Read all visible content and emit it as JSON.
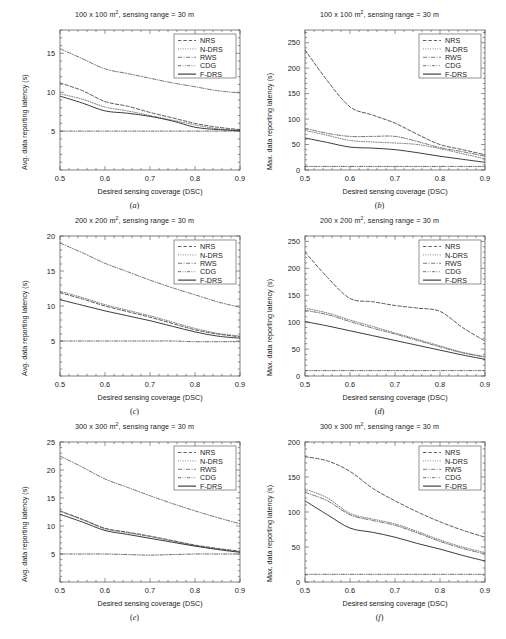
{
  "figure": {
    "xlabel": "Desired sensing coverage (DSC)",
    "ylabel_avg": "Avg. data reporting latency (s)",
    "ylabel_max": "Max. data reporting latency (s)",
    "xticks": [
      "0.5",
      "0.6",
      "0.7",
      "0.8",
      "0.9"
    ],
    "series_names": [
      "NRS",
      "N-DRS",
      "RWS",
      "CDG",
      "F-DRS"
    ],
    "panel_letters": [
      "(a)",
      "(b)",
      "(c)",
      "(d)",
      "(e)",
      "(f)"
    ]
  },
  "chart_data": [
    {
      "id": "a",
      "type": "line",
      "title": "100 x 100 m², sensing range = 30 m",
      "panel_label": "(a)",
      "xlabel": "Desired sensing coverage (DSC)",
      "ylabel": "Avg. data reporting latency (s)",
      "xlim": [
        0.5,
        0.9
      ],
      "ylim": [
        0,
        18
      ],
      "xticks": [
        0.5,
        0.6,
        0.7,
        0.8,
        0.9
      ],
      "yticks": [
        5,
        10,
        15
      ],
      "ytick_labels": [
        "5",
        "10",
        "15"
      ],
      "grid": false,
      "legend_position": "top-right",
      "x": [
        0.5,
        0.55,
        0.6,
        0.65,
        0.7,
        0.75,
        0.8,
        0.85,
        0.9
      ],
      "series": [
        {
          "name": "NRS",
          "style": "dashed",
          "values": [
            11.2,
            10.2,
            8.8,
            8.2,
            7.4,
            6.7,
            6.0,
            5.5,
            5.2
          ]
        },
        {
          "name": "N-DRS",
          "style": "dotted",
          "values": [
            9.8,
            9.1,
            8.1,
            7.6,
            7.0,
            6.4,
            5.8,
            5.3,
            5.0
          ]
        },
        {
          "name": "RWS",
          "style": "dashdot",
          "values": [
            15.6,
            14.3,
            13.0,
            12.4,
            11.8,
            11.2,
            10.7,
            10.2,
            9.9
          ]
        },
        {
          "name": "CDG",
          "style": "dashdotdot",
          "values": [
            5.0,
            5.0,
            5.0,
            5.0,
            5.0,
            5.0,
            5.0,
            5.0,
            5.0
          ]
        },
        {
          "name": "F-DRS",
          "style": "solid",
          "values": [
            9.5,
            8.6,
            7.6,
            7.3,
            6.9,
            6.3,
            5.5,
            5.2,
            5.1
          ]
        }
      ]
    },
    {
      "id": "b",
      "type": "line",
      "title": "100 x 100 m², sensing range = 30 m",
      "panel_label": "(b)",
      "xlabel": "Desired sensing coverage (DSC)",
      "ylabel": "Max. data reporting latency (s)",
      "xlim": [
        0.5,
        0.9
      ],
      "ylim": [
        0,
        275
      ],
      "xticks": [
        0.5,
        0.6,
        0.7,
        0.8,
        0.9
      ],
      "yticks": [
        0,
        50,
        100,
        150,
        200,
        250
      ],
      "ytick_labels": [
        "0",
        "50",
        "100",
        "150",
        "200",
        "250"
      ],
      "grid": false,
      "legend_position": "top-right",
      "x": [
        0.5,
        0.55,
        0.6,
        0.65,
        0.7,
        0.75,
        0.8,
        0.85,
        0.9
      ],
      "series": [
        {
          "name": "NRS",
          "style": "dashed",
          "values": [
            236,
            175,
            124,
            108,
            92,
            70,
            50,
            40,
            30
          ]
        },
        {
          "name": "N-DRS",
          "style": "dotted",
          "values": [
            78,
            68,
            58,
            55,
            53,
            50,
            42,
            32,
            22
          ]
        },
        {
          "name": "RWS",
          "style": "dashdot",
          "values": [
            82,
            72,
            66,
            66,
            66,
            56,
            44,
            36,
            27
          ]
        },
        {
          "name": "CDG",
          "style": "dashdotdot",
          "values": [
            7,
            7,
            7,
            7,
            7,
            7,
            7,
            7,
            7
          ]
        },
        {
          "name": "F-DRS",
          "style": "solid",
          "values": [
            63,
            54,
            45,
            43,
            40,
            34,
            27,
            21,
            15
          ]
        }
      ]
    },
    {
      "id": "c",
      "type": "line",
      "title": "200 x 200 m², sensing range = 30 m",
      "panel_label": "(c)",
      "xlabel": "Desired sensing coverage (DSC)",
      "ylabel": "Avg. data reporting latency (s)",
      "xlim": [
        0.5,
        0.9
      ],
      "ylim": [
        0,
        20
      ],
      "xticks": [
        0.5,
        0.6,
        0.7,
        0.8,
        0.9
      ],
      "yticks": [
        5,
        10,
        15,
        20
      ],
      "ytick_labels": [
        "5",
        "10",
        "15",
        "20"
      ],
      "grid": false,
      "legend_position": "top-right",
      "x": [
        0.5,
        0.55,
        0.6,
        0.65,
        0.7,
        0.75,
        0.8,
        0.85,
        0.9
      ],
      "series": [
        {
          "name": "NRS",
          "style": "dashed",
          "values": [
            11.9,
            11.0,
            10.0,
            9.2,
            8.4,
            7.5,
            6.6,
            6.0,
            5.6
          ]
        },
        {
          "name": "N-DRS",
          "style": "dotted",
          "values": [
            12.1,
            11.2,
            10.2,
            9.4,
            8.6,
            7.7,
            6.8,
            6.1,
            5.7
          ]
        },
        {
          "name": "RWS",
          "style": "dashdot",
          "values": [
            19.0,
            17.6,
            16.1,
            14.9,
            13.7,
            12.6,
            11.6,
            10.6,
            9.8
          ]
        },
        {
          "name": "CDG",
          "style": "dashdotdot",
          "values": [
            5.0,
            5.0,
            5.0,
            5.0,
            5.0,
            5.0,
            4.9,
            4.9,
            4.9
          ]
        },
        {
          "name": "F-DRS",
          "style": "solid",
          "values": [
            10.9,
            10.1,
            9.3,
            8.6,
            7.9,
            7.1,
            6.3,
            5.7,
            5.4
          ]
        }
      ]
    },
    {
      "id": "d",
      "type": "line",
      "title": "200 x 200 m², sensing range = 30 m",
      "panel_label": "(d)",
      "xlabel": "Desired sensing coverage (DSC)",
      "ylabel": "Max. data reporting latency (s)",
      "xlim": [
        0.5,
        0.9
      ],
      "ylim": [
        0,
        260
      ],
      "xticks": [
        0.5,
        0.6,
        0.7,
        0.8,
        0.9
      ],
      "yticks": [
        0,
        50,
        100,
        150,
        200,
        250
      ],
      "ytick_labels": [
        "0",
        "50",
        "100",
        "150",
        "200",
        "250"
      ],
      "grid": false,
      "legend_position": "top-right",
      "x": [
        0.5,
        0.55,
        0.6,
        0.65,
        0.7,
        0.75,
        0.8,
        0.85,
        0.9
      ],
      "series": [
        {
          "name": "NRS",
          "style": "dashed",
          "values": [
            230,
            183,
            144,
            138,
            131,
            126,
            120,
            90,
            65
          ]
        },
        {
          "name": "N-DRS",
          "style": "dotted",
          "values": [
            126,
            117,
            104,
            92,
            80,
            68,
            56,
            44,
            36
          ]
        },
        {
          "name": "RWS",
          "style": "dashdot",
          "values": [
            122,
            114,
            101,
            89,
            78,
            66,
            54,
            43,
            35
          ]
        },
        {
          "name": "CDG",
          "style": "dashdotdot",
          "values": [
            10,
            10,
            10,
            10,
            10,
            10,
            10,
            10,
            10
          ]
        },
        {
          "name": "F-DRS",
          "style": "solid",
          "values": [
            101,
            93,
            84,
            75,
            66,
            57,
            48,
            39,
            31
          ]
        }
      ]
    },
    {
      "id": "e",
      "type": "line",
      "title": "300 x 300 m², sensing range = 30 m",
      "panel_label": "(e)",
      "xlabel": "Desired sensing coverage (DSC)",
      "ylabel": "Avg. data reporting latency (s)",
      "xlim": [
        0.5,
        0.9
      ],
      "ylim": [
        0,
        25
      ],
      "xticks": [
        0.5,
        0.6,
        0.7,
        0.8,
        0.9
      ],
      "yticks": [
        5,
        10,
        15,
        20,
        25
      ],
      "ytick_labels": [
        "5",
        "10",
        "15",
        "20",
        "25"
      ],
      "grid": false,
      "legend_position": "top-right",
      "x": [
        0.5,
        0.55,
        0.6,
        0.65,
        0.7,
        0.75,
        0.8,
        0.85,
        0.9
      ],
      "series": [
        {
          "name": "NRS",
          "style": "dashed",
          "values": [
            12.7,
            11.2,
            9.6,
            8.9,
            8.2,
            7.4,
            6.6,
            6.0,
            5.5
          ]
        },
        {
          "name": "N-DRS",
          "style": "dotted",
          "values": [
            12.6,
            11.1,
            9.5,
            8.8,
            8.1,
            7.3,
            6.5,
            5.9,
            5.4
          ]
        },
        {
          "name": "RWS",
          "style": "dashdot",
          "values": [
            22.5,
            20.5,
            18.4,
            16.9,
            15.4,
            14.0,
            12.7,
            11.5,
            10.4
          ]
        },
        {
          "name": "CDG",
          "style": "dashdotdot",
          "values": [
            5.0,
            5.0,
            5.0,
            4.9,
            4.8,
            4.9,
            5.0,
            5.0,
            5.0
          ]
        },
        {
          "name": "F-DRS",
          "style": "solid",
          "values": [
            12.1,
            10.7,
            9.2,
            8.5,
            7.8,
            7.1,
            6.4,
            5.8,
            5.3
          ]
        }
      ]
    },
    {
      "id": "f",
      "type": "line",
      "title": "300 x 300 m², sensing range = 30 m",
      "panel_label": "(f)",
      "xlabel": "Desired sensing coverage (DSC)",
      "ylabel": "Max. data reporting latency (s)",
      "xlim": [
        0.5,
        0.9
      ],
      "ylim": [
        0,
        200
      ],
      "xticks": [
        0.5,
        0.6,
        0.7,
        0.8,
        0.9
      ],
      "yticks": [
        0,
        50,
        100,
        150,
        200
      ],
      "ytick_labels": [
        "0",
        "50",
        "100",
        "150",
        "200"
      ],
      "grid": false,
      "legend_position": "top-right",
      "x": [
        0.5,
        0.55,
        0.6,
        0.65,
        0.7,
        0.75,
        0.8,
        0.85,
        0.9
      ],
      "series": [
        {
          "name": "NRS",
          "style": "dashed",
          "values": [
            179,
            173,
            158,
            134,
            116,
            100,
            86,
            74,
            64
          ]
        },
        {
          "name": "N-DRS",
          "style": "dotted",
          "values": [
            133,
            120,
            98,
            90,
            83,
            72,
            60,
            50,
            42
          ]
        },
        {
          "name": "RWS",
          "style": "dashdot",
          "values": [
            128,
            116,
            96,
            88,
            81,
            70,
            58,
            48,
            40
          ]
        },
        {
          "name": "CDG",
          "style": "dashdotdot",
          "values": [
            11,
            11,
            11,
            11,
            11,
            11,
            11,
            11,
            11
          ]
        },
        {
          "name": "F-DRS",
          "style": "solid",
          "values": [
            116,
            96,
            77,
            71,
            64,
            55,
            47,
            38,
            30
          ]
        }
      ]
    }
  ]
}
